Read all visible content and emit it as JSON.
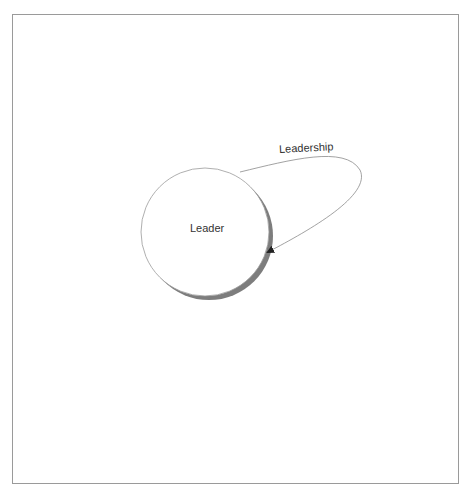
{
  "diagram": {
    "nodes": [
      {
        "id": "leader",
        "label": "Leader",
        "shape": "circle",
        "fill": "#ffffff",
        "stroke": "#8a8a8a",
        "shadow": "#808080"
      }
    ],
    "edges": [
      {
        "from": "leader",
        "to": "leader",
        "label": "Leadership",
        "type": "self-loop",
        "arrow": "end",
        "stroke": "#8a8a8a"
      }
    ]
  },
  "colors": {
    "frame": "#9a9a9a",
    "shadow": "#808080",
    "text": "#333333"
  }
}
